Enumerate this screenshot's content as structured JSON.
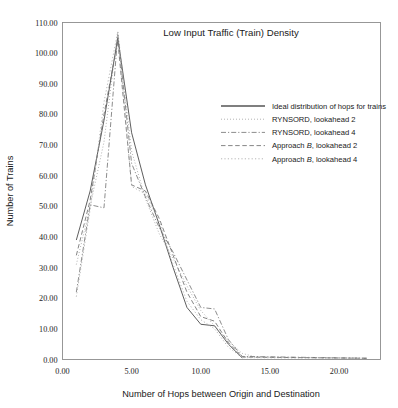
{
  "chart_data": {
    "type": "line",
    "title": "Low Input Traffic (Train) Density",
    "xlabel": "Number of Hops between Origin and Destination",
    "ylabel": "Number of Trains",
    "xlim": [
      0.0,
      23.0
    ],
    "ylim": [
      0.0,
      110.0
    ],
    "xticks": [
      0.0,
      5.0,
      10.0,
      15.0,
      20.0
    ],
    "xticklabels": [
      "0.00",
      "5.00",
      "10.00",
      "15.00",
      "20.00"
    ],
    "yticks": [
      0.0,
      10.0,
      20.0,
      30.0,
      40.0,
      50.0,
      60.0,
      70.0,
      80.0,
      90.0,
      100.0,
      110.0
    ],
    "yticklabels": [
      "0.00",
      "10.00",
      "20.00",
      "30.00",
      "40.00",
      "50.00",
      "60.00",
      "70.00",
      "80.00",
      "90.00",
      "100.00",
      "110.00"
    ],
    "grid": false,
    "legend_position": "upper-right-inside",
    "series": [
      {
        "name": "Ideal distribution of hops for trains",
        "style": "solid",
        "color": "#555555",
        "x": [
          1,
          2,
          3,
          4,
          5,
          6,
          7,
          8,
          9,
          10,
          11,
          12,
          13
        ],
        "y": [
          39.0,
          55.0,
          78.0,
          105.0,
          74.0,
          57.0,
          44.0,
          30.0,
          17.0,
          11.5,
          11.0,
          5.0,
          0.5
        ]
      },
      {
        "name": "RYNSORD, lookahead   2",
        "style": "fine-dotted",
        "color": "#9a9a9a",
        "x": [
          1,
          2,
          3,
          4,
          5,
          6,
          7,
          8,
          9,
          10,
          11,
          12,
          13,
          14,
          22
        ],
        "y": [
          31.0,
          50.0,
          71.0,
          107.0,
          68.0,
          52.5,
          41.0,
          33.0,
          24.0,
          16.0,
          11.0,
          6.0,
          2.0,
          0.8,
          0.4
        ]
      },
      {
        "name": "RYNSORD, lookahead   4",
        "style": "dash-dot",
        "color": "#777777",
        "x": [
          1,
          2,
          3,
          4,
          5,
          6,
          7,
          8,
          9,
          10,
          11,
          12,
          13,
          22
        ],
        "y": [
          22.0,
          50.5,
          49.5,
          106.0,
          64.0,
          53.0,
          43.0,
          35.0,
          26.0,
          17.0,
          16.5,
          6.5,
          1.0,
          0.4
        ]
      },
      {
        "name": "Approach B, lookahead 2",
        "style": "dashed",
        "color": "#6f6f6f",
        "x": [
          1,
          2,
          3,
          4,
          5,
          6,
          7,
          8,
          9,
          10,
          11,
          12,
          13,
          22
        ],
        "y": [
          34.0,
          52.0,
          80.0,
          104.0,
          57.0,
          55.0,
          46.0,
          34.0,
          22.0,
          14.0,
          12.5,
          5.5,
          0.8,
          0.4
        ]
      },
      {
        "name": "Approach B, lookahead 4",
        "style": "dotted",
        "color": "#a8a8a8",
        "x": [
          1,
          2,
          3,
          4,
          5,
          6,
          7,
          8,
          9,
          10,
          11,
          12,
          13,
          22
        ],
        "y": [
          20.5,
          49.0,
          84.0,
          107.0,
          56.5,
          54.0,
          45.0,
          31.0,
          19.0,
          13.0,
          10.0,
          4.0,
          0.6,
          0.4
        ]
      }
    ]
  },
  "legend": {
    "entries": [
      {
        "label": "Ideal distribution of hops for trains",
        "italic_part": "",
        "style": "solid"
      },
      {
        "label": "RYNSORD, lookahead   2",
        "italic_part": "",
        "style": "fine-dotted"
      },
      {
        "label": "RYNSORD, lookahead   4",
        "italic_part": "",
        "style": "dash-dot"
      },
      {
        "label_pre": "Approach ",
        "italic_part": "B",
        "label_post": ", lookahead 2",
        "style": "dashed"
      },
      {
        "label_pre": "Approach ",
        "italic_part": "B",
        "label_post": ", lookahead 4",
        "style": "dotted"
      }
    ]
  },
  "colors": {
    "background": "#ffffff",
    "frame": "#8d8d8d",
    "text": "#1a1a1a"
  }
}
